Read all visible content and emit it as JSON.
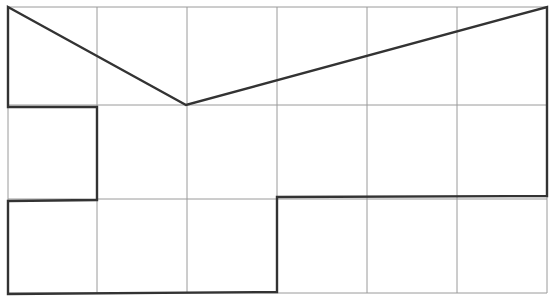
{
  "diagram": {
    "type": "grid-polygon",
    "background": "#ffffff",
    "grid": {
      "columns": 6,
      "rows": 3,
      "x_lines": [
        8,
        97,
        187,
        277,
        367,
        457,
        547
      ],
      "y_lines": [
        7,
        105,
        199,
        293
      ],
      "color": "#9a9a9a",
      "stroke_width": 1
    },
    "shape": {
      "color": "#333333",
      "stroke_width": 2.4,
      "points": [
        [
          8,
          7
        ],
        [
          186,
          105
        ],
        [
          547,
          7
        ],
        [
          547,
          196
        ],
        [
          277,
          197
        ],
        [
          277,
          292
        ],
        [
          8,
          294
        ],
        [
          8,
          201
        ],
        [
          97,
          200
        ],
        [
          97,
          107
        ],
        [
          8,
          107
        ]
      ]
    }
  }
}
